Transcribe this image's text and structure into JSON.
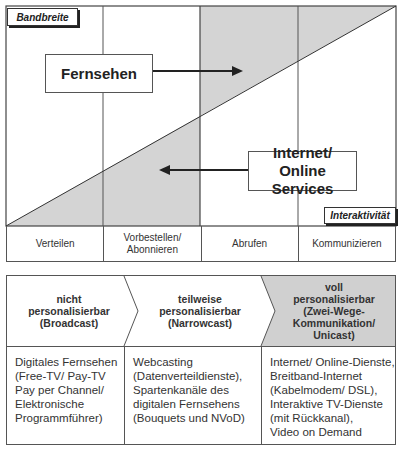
{
  "diagram": {
    "y_axis_label": "Bandbreite",
    "x_axis_label": "Interaktivität",
    "upper_box": {
      "label": "Fernsehen",
      "arrow_direction": "right"
    },
    "lower_box": {
      "label_line1": "Internet/",
      "label_line2": "Online Services",
      "arrow_direction": "left"
    },
    "columns": [
      {
        "label": "Verteilen"
      },
      {
        "label_line1": "Vorbestellen/",
        "label_line2": "Abonnieren"
      },
      {
        "label": "Abrufen"
      },
      {
        "label": "Kommunizieren"
      }
    ],
    "colors": {
      "shade": "#d4d4d4",
      "line": "#444444",
      "background": "#ffffff"
    }
  },
  "table": {
    "headers": [
      {
        "line1": "nicht",
        "line2": "personalisierbar",
        "line3": "(Broadcast)"
      },
      {
        "line1": "teilweise",
        "line2": "personalisierbar",
        "line3": "(Narrowcast)"
      },
      {
        "line1": "voll",
        "line2": "personalisierbar",
        "line3": "(Zwei-Wege-",
        "line4": "Kommunikation/",
        "line5": "Unicast)"
      }
    ],
    "cells": [
      "Digitales Fernsehen\n(Free-TV/ Pay-TV\nPay per Channel/\nElektronische\nProgrammführer)",
      "Webcasting\n(Datenverteildienste),\nSpartenkanäle des\ndigitalen Fernsehens\n(Bouquets und NVoD)",
      "Internet/ Online-Dienste,\nBreitband-Internet\n(Kabelmodem/ DSL),\nInteraktive TV-Dienste\n(mit Rückkanal),\nVideo on Demand"
    ],
    "colors": {
      "header_shaded": "#d0d0d0",
      "border": "#555555"
    }
  }
}
